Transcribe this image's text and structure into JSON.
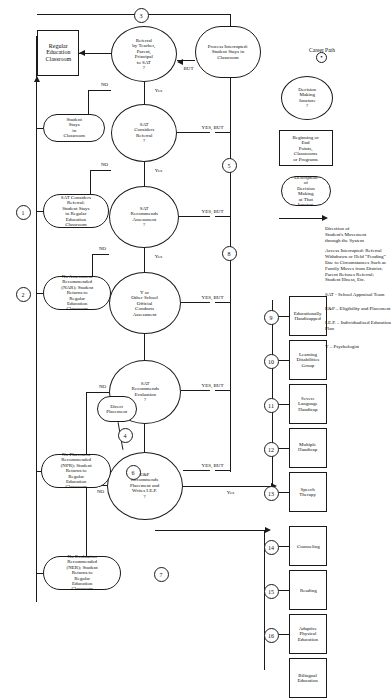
{
  "diagram": {
    "legend": {
      "career_path_label": "Career Path",
      "career_path_symbol": "⊙",
      "decision_juncture_label": "Decision\nMaking\nJuncture\n?",
      "endpoint_label": "Beginning or End\nPoints, Classrooms\nor Programs",
      "description_label": "Description of\nDecision Making\nat That Juncture",
      "direction_label": "Direction of\nStudent's Movement\nthrough the System",
      "interrupt_note": "Access Interrupted:  Referral\nWithdrawn or Held “Pending”\nDue to Circumstances Such as\nFamily Moves from District;\nParent Refuses Referral;\nStudent Illness, Etc.",
      "abbrev_sat": "SAT - School Appraisal Team",
      "abbrev_eandp": "E&P – Eligibility and Placement",
      "abbrev_iep": "I.E.P. – Individualized Education\nPlan",
      "abbrev_y": "Y – Psychologist"
    },
    "nodes": {
      "regular_education_classroom": "Regular\nEducation\nClassroom",
      "referral_decision": "Referral\nby Teacher,\nParent,\nPrincipal\nto SAT\n?",
      "sat_considers_referral_decision": "SAT\nConsiders\nReferral\n?",
      "sat_recommends_assessment_decision": "SAT\nRecommends\nAssessment\n?",
      "y_conducts_assessment": "Y or\nOther School\nOfficial\nConducts\nAssessment",
      "sat_recommends_evaluation_decision": "SAT\nRecommends\nEvaluation\n?",
      "eandp_recommends_decision": "E&P\nRecommends\nPlacement and\nWrites I.E.P.\n?",
      "process_interrupted": "Process Interrupted:\nStudent Stays in\nClassroom",
      "student_stays_in_classroom": "Student Stays\nin Classroom",
      "sat_considers_referral_stays": "SAT Considers Referral;\nStudent Stays in Regular\nEducation Classroom",
      "no_assessment_recommended": "No Assessment Recommended\n(NAR); Student Returns to\nRegular Education Classroom",
      "no_evaluation_recommended": "No Evaluation Recommended\n(NER); Student Returns to\nRegular Education Classroom",
      "no_placement_recommended": "No Placement Recommended\n(NPR); Student Returns to\nRegular Education Classroom",
      "direct_placement": "Direct\nPlacement"
    },
    "programs_upper": [
      {
        "marker": "9",
        "label": "Educationally\nHandicapped"
      },
      {
        "marker": "10",
        "label": "Learning\nDisabilities\nGroup"
      },
      {
        "marker": "11",
        "label": "Severe\nLanguage\nHandicap"
      },
      {
        "marker": "12",
        "label": "Multiple\nHandicap"
      },
      {
        "marker": "13",
        "label": "Speech\nTherapy"
      }
    ],
    "programs_lower": [
      {
        "marker": "14",
        "label": "Counseling"
      },
      {
        "marker": "15",
        "label": "Reading"
      },
      {
        "marker": "16",
        "label": "Adaptive\nPhysical\nEducation"
      },
      {
        "marker": "17",
        "label": "Bilingual\nEducation"
      }
    ],
    "edge_labels": {
      "yes": "Yes",
      "no": "NO",
      "yes_but": "YES, BUT",
      "but": "BUT"
    },
    "path_markers": [
      "1",
      "2",
      "3",
      "4",
      "5",
      "6",
      "7",
      "8"
    ]
  }
}
